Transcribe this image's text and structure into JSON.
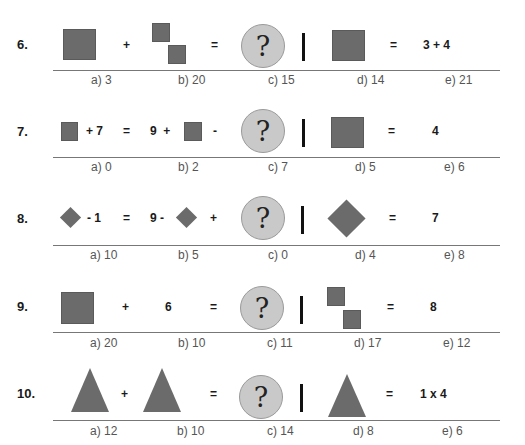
{
  "questions": [
    {
      "number": "6.",
      "left_term_1": "square",
      "op_1": "+",
      "left_term_2": "two-squares",
      "op_2": "=",
      "unknown": "?",
      "right_shape": "square",
      "right_eq": "=",
      "right_value": "3 + 4",
      "answers": [
        "a) 3",
        "b) 20",
        "c) 15",
        "d) 14",
        "e) 21"
      ]
    },
    {
      "number": "7.",
      "left_text_1": "+ 7",
      "eq": "=",
      "left_text_2": "9  +",
      "op_2": "-",
      "unknown": "?",
      "right_shape": "square",
      "right_eq": "=",
      "right_value": "4",
      "answers": [
        "a) 0",
        "b) 2",
        "c) 7",
        "d) 5",
        "e) 6"
      ]
    },
    {
      "number": "8.",
      "left_text_1": "- 1",
      "eq": "=",
      "left_text_2": "9 -",
      "op_2": "+",
      "unknown": "?",
      "right_shape": "diamond",
      "right_eq": "=",
      "right_value": "7",
      "answers": [
        "a) 10",
        "b) 5",
        "c) 0",
        "d) 4",
        "e) 8"
      ]
    },
    {
      "number": "9.",
      "op_1": "+",
      "middle_value": "6",
      "eq": "=",
      "unknown": "?",
      "right_shape": "two-squares",
      "right_eq": "=",
      "right_value": "8",
      "answers": [
        "a) 20",
        "b) 10",
        "c) 11",
        "d) 17",
        "e) 12"
      ]
    },
    {
      "number": "10.",
      "op_1": "+",
      "eq": "=",
      "unknown": "?",
      "right_shape": "triangle",
      "right_eq": "=",
      "right_value": "1 x 4",
      "answers": [
        "a) 12",
        "b) 10",
        "c) 14",
        "d) 8",
        "e) 6"
      ]
    }
  ],
  "colors": {
    "shape_fill": "#6b6b6b",
    "circle_fill": "#c9c9c9",
    "line": "#777777",
    "answer_text": "#555555"
  }
}
